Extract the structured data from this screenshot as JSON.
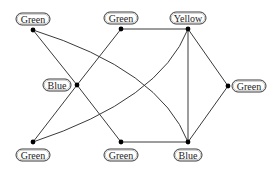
{
  "diagram": {
    "type": "graph-coloring",
    "nodes": [
      {
        "id": "n1",
        "label": "Green",
        "x": 33,
        "y": 30,
        "lx": 33,
        "ly": 19,
        "lw": 34
      },
      {
        "id": "n2",
        "label": "Green",
        "x": 121,
        "y": 29,
        "lx": 121,
        "ly": 18,
        "lw": 34
      },
      {
        "id": "n3",
        "label": "Yellow",
        "x": 188,
        "y": 29,
        "lx": 188,
        "ly": 18,
        "lw": 36
      },
      {
        "id": "n4",
        "label": "Blue",
        "x": 77,
        "y": 85,
        "lx": 57,
        "ly": 85,
        "lw": 28
      },
      {
        "id": "n5",
        "label": "Green",
        "x": 228,
        "y": 86,
        "lx": 249,
        "ly": 86,
        "lw": 34
      },
      {
        "id": "n6",
        "label": "Green",
        "x": 33,
        "y": 142,
        "lx": 33,
        "ly": 155,
        "lw": 34
      },
      {
        "id": "n7",
        "label": "Green",
        "x": 121,
        "y": 142,
        "lx": 121,
        "ly": 155,
        "lw": 34
      },
      {
        "id": "n8",
        "label": "Blue",
        "x": 188,
        "y": 142,
        "lx": 188,
        "ly": 155,
        "lw": 28
      }
    ],
    "edges": [
      {
        "from": "n1",
        "to": "n4",
        "path": "M33,30 L77,85"
      },
      {
        "from": "n4",
        "to": "n7",
        "path": "M77,85 L121,142"
      },
      {
        "from": "n2",
        "to": "n4",
        "path": "M121,29 L77,85"
      },
      {
        "from": "n4",
        "to": "n6",
        "path": "M77,85 L33,142"
      },
      {
        "from": "n1",
        "to": "n8",
        "path": "M33,30 Q160,70 188,142"
      },
      {
        "from": "n3",
        "to": "n6",
        "path": "M188,29 Q160,100 33,142"
      },
      {
        "from": "n2",
        "to": "n3",
        "path": "M121,29 L188,29"
      },
      {
        "from": "n3",
        "to": "n8",
        "path": "M188,29 L188,142"
      },
      {
        "from": "n3",
        "to": "n5",
        "path": "M188,29 L228,86"
      },
      {
        "from": "n5",
        "to": "n8",
        "path": "M228,86 L188,142"
      },
      {
        "from": "n7",
        "to": "n8",
        "path": "M121,142 L188,142"
      }
    ]
  }
}
